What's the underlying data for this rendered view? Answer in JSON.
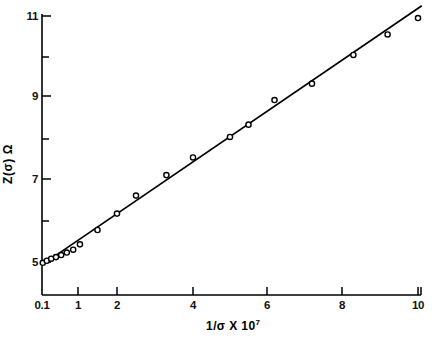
{
  "chart_data": {
    "type": "scatter",
    "title": "",
    "subtitle": "",
    "xlabel": "1/σ X 10",
    "xlabel_exponent": "7",
    "ylabel": "Z(σ) Ω",
    "legend": [],
    "grid": false,
    "xlim": [
      0.1,
      10
    ],
    "ylim": [
      4.2,
      11.3
    ],
    "xtick_labels": [
      "0.1",
      "1",
      "2",
      "4",
      "6",
      "8",
      "10"
    ],
    "xtick_values": [
      0.1,
      1,
      2,
      4,
      6,
      8,
      10
    ],
    "ytick_labels": [
      "5",
      "7",
      "9",
      "11"
    ],
    "ytick_values": [
      5,
      7,
      9,
      11
    ],
    "yminor_values": [
      6,
      8,
      10
    ],
    "series": [
      {
        "name": "Z(σ) data points",
        "marker": "open-circle",
        "x": [
          0.12,
          0.22,
          0.33,
          0.45,
          0.58,
          0.72,
          0.88,
          1.05,
          1.5,
          2.0,
          2.5,
          3.3,
          4.0,
          5.0,
          5.5,
          6.2,
          7.2,
          8.3,
          9.2,
          10.0
        ],
        "y": [
          4.98,
          5.03,
          5.08,
          5.12,
          5.17,
          5.23,
          5.3,
          5.43,
          5.78,
          6.18,
          6.62,
          7.12,
          7.55,
          8.05,
          8.35,
          8.95,
          9.35,
          10.05,
          10.55,
          10.95
        ]
      }
    ],
    "fit_line": {
      "name": "linear fit",
      "x": [
        0.1,
        10.1
      ],
      "y": [
        4.93,
        11.25
      ]
    },
    "axis_color": "#000000",
    "marker_color": "#000000",
    "line_color": "#000000"
  },
  "axes_geometry": {
    "note": "pixel mapping used by template",
    "x_pixels": [
      42,
      78,
      117,
      193,
      267,
      342,
      418
    ],
    "y_pixels": [
      262,
      179,
      96,
      16
    ],
    "axis_left_px": 42,
    "axis_bottom_px": 295,
    "axis_top_px": 14,
    "axis_right_px": 421
  }
}
